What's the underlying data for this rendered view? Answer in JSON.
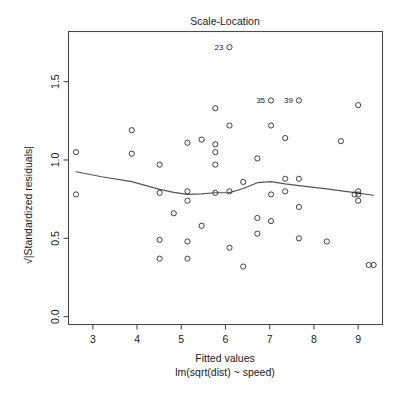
{
  "figure": {
    "type": "r-diagnostic-plot",
    "background_color": "#ffffff",
    "foreground_color": "#1a1a1a",
    "point_color": "#2b2b2b",
    "smooth_color": "#555555"
  },
  "chart_data": {
    "type": "scatter",
    "title": "Scale-Location",
    "xlabel_line1": "Fitted values",
    "xlabel_line2": "lm(sqrt(dist) ~ speed)",
    "ylabel": "√|Standardized residuals|",
    "xlim": [
      2.45,
      9.55
    ],
    "ylim": [
      -0.05,
      1.82
    ],
    "xticks": [
      3,
      4,
      5,
      6,
      7,
      8,
      9
    ],
    "xtick_labels": [
      "3",
      "4",
      "5",
      "6",
      "7",
      "8",
      "9"
    ],
    "yticks": [
      0.0,
      0.5,
      1.0,
      1.5
    ],
    "ytick_labels": [
      "0.0",
      "0.5",
      "1.0",
      "1.5"
    ],
    "grid": false,
    "legend": "none",
    "x": [
      2.62,
      2.62,
      3.88,
      3.88,
      4.51,
      4.51,
      4.51,
      4.51,
      4.83,
      5.14,
      5.14,
      5.14,
      5.14,
      5.14,
      5.46,
      5.46,
      5.77,
      5.77,
      5.77,
      5.77,
      5.77,
      6.09,
      6.09,
      6.09,
      6.09,
      6.4,
      6.4,
      6.72,
      6.72,
      6.72,
      7.03,
      7.03,
      7.03,
      7.03,
      7.35,
      7.35,
      7.35,
      7.66,
      7.66,
      7.66,
      7.66,
      8.29,
      8.61,
      8.92,
      9.0,
      9.0,
      9.0,
      9.0,
      9.24,
      9.35
    ],
    "y": [
      1.05,
      0.78,
      1.19,
      1.04,
      0.97,
      0.79,
      0.49,
      0.37,
      0.66,
      1.11,
      0.8,
      0.74,
      0.48,
      0.37,
      1.13,
      0.58,
      1.1,
      1.33,
      1.05,
      0.97,
      0.79,
      1.22,
      0.8,
      0.44,
      1.72,
      0.86,
      0.32,
      1.01,
      0.63,
      0.53,
      1.22,
      1.38,
      0.78,
      0.61,
      1.14,
      0.88,
      0.8,
      0.88,
      1.38,
      0.7,
      0.5,
      0.48,
      1.12,
      0.78,
      0.8,
      0.78,
      0.74,
      1.35,
      0.33,
      0.33
    ],
    "labelled_points": [
      {
        "label": "23",
        "x": 6.09,
        "y": 1.72,
        "anchor": "left-of-point"
      },
      {
        "label": "35",
        "x": 7.03,
        "y": 1.38,
        "anchor": "left-of-point"
      },
      {
        "label": "39",
        "x": 7.66,
        "y": 1.38,
        "anchor": "left-of-point"
      }
    ],
    "smooth_curve": {
      "name": "lowess",
      "x": [
        2.62,
        3.2,
        3.88,
        4.51,
        4.83,
        5.14,
        5.46,
        5.77,
        6.09,
        6.4,
        6.72,
        7.03,
        7.35,
        7.66,
        8.29,
        8.92,
        9.35
      ],
      "y": [
        0.925,
        0.893,
        0.862,
        0.812,
        0.793,
        0.78,
        0.784,
        0.791,
        0.792,
        0.818,
        0.855,
        0.862,
        0.847,
        0.836,
        0.816,
        0.792,
        0.775
      ]
    }
  }
}
